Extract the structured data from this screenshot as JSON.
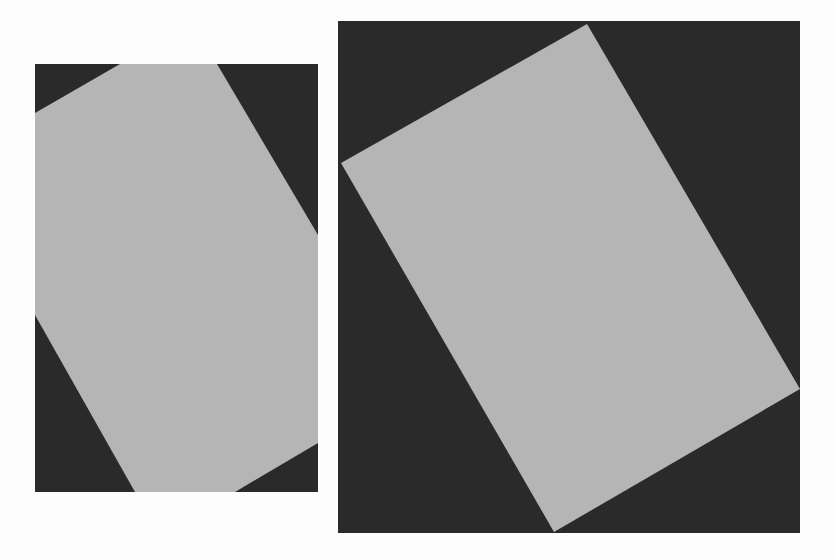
{
  "figure": {
    "colors": {
      "background": "#fdfdfd",
      "dark": "#2a2a2a",
      "light": "#b5b5b5"
    },
    "panels": [
      {
        "name": "original-rotated-rectangle",
        "frame": {
          "x": 35,
          "y": 64,
          "width": 283,
          "height": 428
        },
        "polygon": "85,0 182,0 283,171 283,379 200,428 100,428 0,251 0,49"
      },
      {
        "name": "rotated-image-expanded",
        "frame": {
          "x": 338,
          "y": 21,
          "width": 462,
          "height": 512
        },
        "polygon": "249,3 462,368 216,511 3,142"
      }
    ]
  }
}
